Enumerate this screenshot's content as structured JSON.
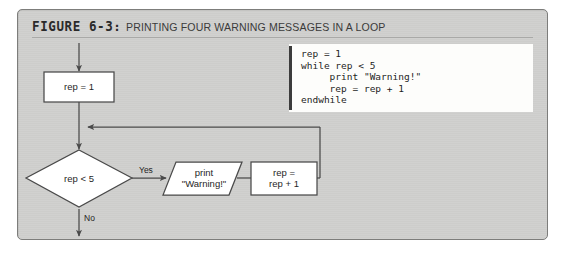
{
  "figure": {
    "number": "FIGURE 6-3",
    "colon": ":",
    "caption": "PRINTING FOUR WARNING MESSAGES IN A LOOP"
  },
  "code": {
    "language": "pseudocode",
    "text": "rep = 1\nwhile rep < 5\n     print \"Warning!\"\n     rep = rep + 1\nendwhile",
    "lines": [
      "rep = 1",
      "while rep < 5",
      "     print \"Warning!\"",
      "     rep = rep + 1",
      "endwhile"
    ]
  },
  "flowchart": {
    "nodes": {
      "init": {
        "shape": "process",
        "text": "rep = 1"
      },
      "decision": {
        "shape": "decision",
        "text": "rep < 5"
      },
      "output": {
        "shape": "io",
        "text": "print\n\"Warning!\""
      },
      "increment": {
        "shape": "process",
        "text": "rep =\nrep + 1"
      }
    },
    "edges": {
      "yes_label": "Yes",
      "no_label": "No"
    }
  },
  "colors": {
    "panel_background": "#cfcfcd",
    "panel_border": "#7d7d7b",
    "code_background": "#fdfdfb",
    "code_bar": "#3c3c3c",
    "node_fill": "#ffffff",
    "node_stroke": "#4a4a4a",
    "connector": "#4a4a4a",
    "text": "#1f1f1f",
    "page_background": "#ffffff"
  }
}
